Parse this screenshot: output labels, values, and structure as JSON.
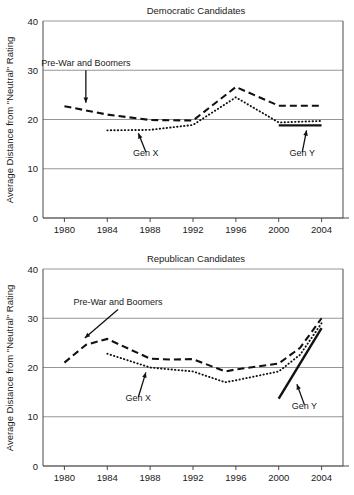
{
  "figure": {
    "ylabel": "Average Distance from \"Neutral\" Rating"
  },
  "chart_data": [
    {
      "type": "line",
      "title": "Democratic Candidates",
      "xlabel": "",
      "ylabel": "Average Distance from \"Neutral\" Rating",
      "x": [
        1980,
        1984,
        1988,
        1992,
        1996,
        2000,
        2004
      ],
      "xticks": [
        "1980",
        "1984",
        "1988",
        "1992",
        "1996",
        "2000",
        "2004"
      ],
      "yticks": [
        "0",
        "10",
        "20",
        "30",
        "40"
      ],
      "xlim": [
        1978,
        2006
      ],
      "ylim": [
        0,
        40
      ],
      "grid": true,
      "legend": "annotations",
      "series": [
        {
          "name": "Pre-War and Boomers",
          "style": "dashed",
          "x": [
            1980,
            1984,
            1988,
            1992,
            1996,
            2000,
            2004
          ],
          "values": [
            22.7,
            21.0,
            19.9,
            19.8,
            26.6,
            22.8,
            22.8
          ]
        },
        {
          "name": "Gen X",
          "style": "dotted",
          "x": [
            1984,
            1988,
            1992,
            1996,
            2000,
            2004
          ],
          "values": [
            17.8,
            17.9,
            18.9,
            24.5,
            19.4,
            19.7
          ]
        },
        {
          "name": "Gen Y",
          "style": "solid",
          "x": [
            2000,
            2004
          ],
          "values": [
            18.8,
            18.8
          ]
        }
      ],
      "annotations": [
        {
          "text": "Pre-War and Boomers",
          "x": 1982.0,
          "y": 30.8,
          "arrow_to_x": 1982.0,
          "arrow_to_y": 23.4,
          "direction": "down"
        },
        {
          "text": "Gen X",
          "x": 1987.6,
          "y": 12.6,
          "arrow_to_x": 1986.9,
          "arrow_to_y": 17.2,
          "direction": "up"
        },
        {
          "text": "Gen Y",
          "x": 2002.2,
          "y": 12.6,
          "arrow_to_x": 2002.6,
          "arrow_to_y": 17.8,
          "direction": "up"
        }
      ]
    },
    {
      "type": "line",
      "title": "Republican Candidates",
      "xlabel": "",
      "ylabel": "Average Distance from \"Neutral\" Rating",
      "x": [
        1980,
        1984,
        1988,
        1992,
        1996,
        2000,
        2004
      ],
      "xticks": [
        "1980",
        "1984",
        "1988",
        "1992",
        "1996",
        "2000",
        "2004"
      ],
      "yticks": [
        "0",
        "10",
        "20",
        "30",
        "40"
      ],
      "xlim": [
        1978,
        2006
      ],
      "ylim": [
        0,
        40
      ],
      "grid": true,
      "legend": "annotations",
      "series": [
        {
          "name": "Pre-War and Boomers",
          "style": "dashed",
          "x": [
            1980,
            1982,
            1984,
            1988,
            1990,
            1992,
            1995,
            1996,
            2000,
            2002,
            2004
          ],
          "values": [
            21.0,
            24.6,
            25.8,
            21.8,
            21.6,
            21.7,
            19.2,
            19.6,
            20.8,
            24.0,
            30.0
          ]
        },
        {
          "name": "Gen X",
          "style": "dotted",
          "x": [
            1984,
            1988,
            1990,
            1992,
            1995,
            1996,
            2000,
            2002,
            2004
          ],
          "values": [
            22.8,
            20.0,
            19.6,
            19.2,
            17.0,
            17.4,
            19.2,
            22.6,
            29.0
          ]
        },
        {
          "name": "Gen Y",
          "style": "solid",
          "x": [
            2000,
            2004
          ],
          "values": [
            13.7,
            28.0
          ]
        }
      ],
      "annotations": [
        {
          "text": "Pre-War and Boomers",
          "x": 1985.0,
          "y": 32.6,
          "arrow_to_x": 1981.9,
          "arrow_to_y": 26.0,
          "direction": "down"
        },
        {
          "text": "Gen X",
          "x": 1986.9,
          "y": 13.2,
          "arrow_to_x": 1987.6,
          "arrow_to_y": 19.0,
          "direction": "up"
        },
        {
          "text": "Gen Y",
          "x": 2002.4,
          "y": 11.6,
          "arrow_to_x": 2001.7,
          "arrow_to_y": 16.6,
          "direction": "up"
        }
      ]
    }
  ]
}
